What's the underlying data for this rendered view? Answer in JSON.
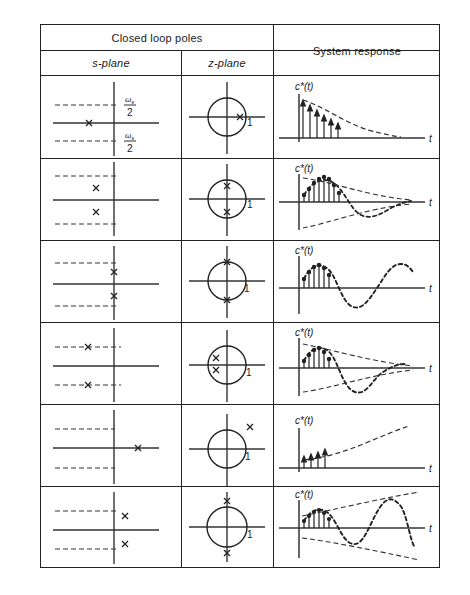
{
  "figure": {
    "title_note": "Closed-loop pole locations in the s-plane and z-plane with corresponding sampled system responses",
    "columns": {
      "group_header": "Closed loop poles",
      "s_plane": "s-plane",
      "z_plane": "z-plane",
      "response": "System response"
    },
    "axis_labels": {
      "response_signal": "c*(t)",
      "time": "t",
      "half_sampling_upper": "ωs",
      "half_sampling_lower": "ωs",
      "half_denominator": "2",
      "unit_circle_radius": "1",
      "pole_marker": "x"
    },
    "colors": {
      "ink": "#1a1a1a",
      "rule": "#222222",
      "background": "#ffffff"
    },
    "rows": [
      {
        "id": "row-1",
        "s_plane_description": "Single real pole on negative real axis, between the ±ωs/2 dashed lines",
        "s_pole_count": 1,
        "z_plane_description": "Single real pole inside the unit circle on positive real axis",
        "z_pole_count": 1,
        "response_description": "Monotonically decaying exponential sampled sequence",
        "response_type": "decaying-exponential",
        "stable": true,
        "oscillatory": false,
        "samples": [
          0.92,
          0.74,
          0.58,
          0.45,
          0.35,
          0.27
        ],
        "envelope": "decaying"
      },
      {
        "id": "row-2",
        "s_plane_description": "Complex conjugate pole pair in left half plane, low frequency, inside ±ωs/2",
        "s_pole_count": 2,
        "z_plane_description": "Complex conjugate pole pair inside the unit circle near the imaginary axis",
        "z_pole_count": 2,
        "response_description": "Damped sinusoidal oscillation decaying inside an exponential envelope",
        "response_type": "damped-oscillation",
        "stable": true,
        "oscillatory": true,
        "samples": [
          0.3,
          0.62,
          0.84,
          0.9,
          0.72,
          0.32,
          -0.18,
          -0.5,
          -0.46,
          -0.1,
          0.24,
          0.34
        ],
        "envelope": "decaying"
      },
      {
        "id": "row-3",
        "s_plane_description": "Complex conjugate pole pair on the imaginary axis (undamped)",
        "s_pole_count": 2,
        "z_plane_description": "Complex conjugate pole pair on the unit circle",
        "z_pole_count": 2,
        "response_description": "Constant amplitude sustained sinusoidal oscillation",
        "response_type": "sustained-oscillation",
        "stable": false,
        "oscillatory": true,
        "samples": [
          0.34,
          0.66,
          0.86,
          0.94,
          0.8,
          0.44,
          -0.06,
          -0.54,
          -0.84,
          -0.92,
          -0.66,
          -0.18,
          0.4,
          0.82
        ],
        "envelope": "constant"
      },
      {
        "id": "row-4",
        "s_plane_description": "Complex conjugate pole pair on the ±ωs/2 lines in the left half plane",
        "s_pole_count": 2,
        "z_plane_description": "Two real poles inside the unit circle on the negative real axis",
        "z_pole_count": 2,
        "response_description": "Decaying oscillation at half the sampling frequency",
        "response_type": "damped-half-rate-oscillation",
        "stable": true,
        "oscillatory": true,
        "samples": [
          0.26,
          0.6,
          0.82,
          0.88,
          0.7,
          0.26,
          -0.3,
          -0.66,
          -0.6,
          -0.22,
          0.18,
          0.3
        ],
        "envelope": "decaying"
      },
      {
        "id": "row-5",
        "s_plane_description": "Single real pole in the right half plane on the positive real axis",
        "s_pole_count": 1,
        "z_plane_description": "Single real pole outside the unit circle on the positive real axis",
        "z_pole_count": 1,
        "response_description": "Monotonically growing exponential sampled sequence",
        "response_type": "growing-exponential",
        "stable": false,
        "oscillatory": false,
        "samples": [
          0.2,
          0.27,
          0.36,
          0.48
        ],
        "envelope": "growing"
      },
      {
        "id": "row-6",
        "s_plane_description": "Complex conjugate pole pair in the right half plane",
        "s_pole_count": 2,
        "z_plane_description": "Complex conjugate pole pair outside the unit circle on the imaginary axis",
        "z_pole_count": 2,
        "response_description": "Growing sinusoidal oscillation inside an expanding exponential envelope",
        "response_type": "growing-oscillation",
        "stable": false,
        "oscillatory": true,
        "samples": [
          0.2,
          0.44,
          0.62,
          0.7,
          0.56,
          0.2,
          -0.3,
          -0.62,
          -0.4,
          0.2,
          0.78,
          1.0,
          0.62,
          -0.2,
          -0.9,
          -1.1
        ],
        "envelope": "growing"
      }
    ]
  }
}
